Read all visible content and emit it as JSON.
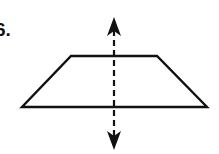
{
  "problem": {
    "number_label": "6."
  },
  "figure": {
    "shape": "isosceles trapezoid",
    "stroke_color": "#111111",
    "background_color": "#ffffff",
    "vertices": {
      "top_left": [
        71,
        56
      ],
      "top_right": [
        157,
        56
      ],
      "bottom_right": [
        207,
        107
      ],
      "bottom_left": [
        22,
        107
      ]
    },
    "symmetry_line": {
      "style": "dashed",
      "x": 114,
      "y_top": 17,
      "y_bottom": 150,
      "arrowheads": [
        "up",
        "down"
      ]
    }
  }
}
